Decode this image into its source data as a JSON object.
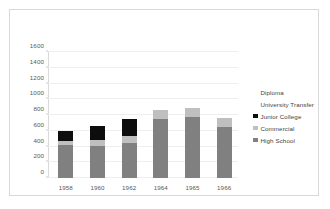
{
  "chart_data": {
    "type": "bar",
    "subtype": "stacked",
    "title": "",
    "xlabel": "",
    "ylabel": "",
    "categories": [
      "1958",
      "1960",
      "1962",
      "1964",
      "1965",
      "1966"
    ],
    "series": [
      {
        "name": "High School",
        "color": "#808080",
        "values": [
          420,
          405,
          450,
          745,
          775,
          650
        ]
      },
      {
        "name": "Commercial",
        "color": "#bfbfbf",
        "values": [
          55,
          75,
          85,
          120,
          115,
          110
        ]
      },
      {
        "name": "Junior College",
        "color": "#0d0d0d",
        "values": [
          120,
          180,
          215,
          0,
          0,
          0
        ]
      },
      {
        "name": "University Transfer",
        "color": "#ffffff",
        "values": [
          0,
          0,
          0,
          0,
          0,
          0
        ]
      },
      {
        "name": "Diploma",
        "color": "#ffffff",
        "values": [
          0,
          0,
          0,
          0,
          0,
          0
        ]
      }
    ],
    "totals": [
      595,
      660,
      750,
      865,
      890,
      760
    ],
    "ylim": [
      0,
      1600
    ],
    "ytick_labels": [
      "0",
      "200",
      "400",
      "600",
      "800",
      "1000",
      "1200",
      "1400",
      "1600"
    ],
    "ytick_values": [
      0,
      200,
      400,
      600,
      800,
      1000,
      1200,
      1400,
      1600
    ],
    "grid": true,
    "legend_position": "right",
    "legend_entries": [
      {
        "label": "Diploma",
        "color": "#ffffff"
      },
      {
        "label": "University Transfer",
        "color": "#ffffff"
      },
      {
        "label": "Junior College",
        "color": "#0d0d0d"
      },
      {
        "label": "Commercial",
        "color": "#bfbfbf"
      },
      {
        "label": "High School",
        "color": "#808080"
      }
    ]
  }
}
